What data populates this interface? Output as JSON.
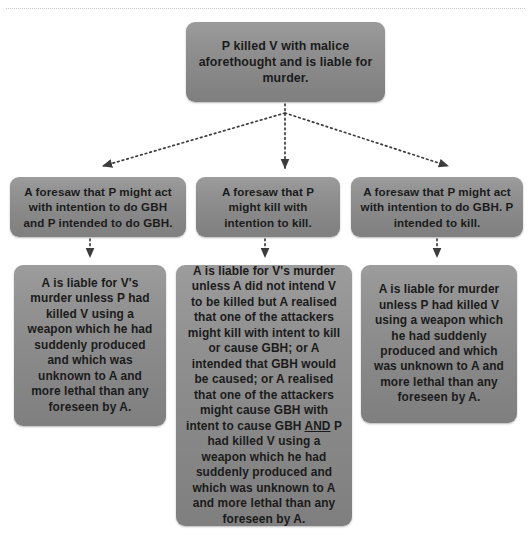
{
  "diagram": {
    "type": "flowchart",
    "title_text": "P killed V with malice aforethought and is liable for murder.",
    "root": {
      "id": "root",
      "text": "P killed V with malice aforethought and is liable for murder."
    },
    "branches": [
      {
        "id": "branch-1",
        "text": "A foresaw that P might act with intention to do GBH and P intended to do GBH."
      },
      {
        "id": "branch-2",
        "text": "A foresaw that P might kill with intention to kill."
      },
      {
        "id": "branch-3",
        "text": "A foresaw that P might act with intention to do GBH. P intended to kill."
      }
    ],
    "outcomes": [
      {
        "id": "outcome-1",
        "text": "A is liable for V's murder unless P had killed V using a weapon which he had suddenly produced and which was unknown to A and more lethal than any foreseen by A."
      },
      {
        "id": "outcome-2",
        "text_before_emphasis": "A is liable for V's murder unless A did not intend V to be killed but A realised that one of the attackers might kill with intent to kill or cause GBH; or A intended that GBH would be caused; or A realised that one of the attackers might cause GBH with intent to cause GBH ",
        "emphasis": "AND",
        "text_after_emphasis": " P had killed V using a weapon which he had suddenly produced and which was unknown to A and more lethal than any foreseen by A."
      },
      {
        "id": "outcome-3",
        "text": "A is liable for murder unless P had killed V using a weapon which he had suddenly produced and which was unknown to A and more lethal than any foreseen by A."
      }
    ],
    "connectors": [
      {
        "from": "root",
        "to": "branch-1",
        "style": "dotted-arrow"
      },
      {
        "from": "root",
        "to": "branch-2",
        "style": "dotted-arrow"
      },
      {
        "from": "root",
        "to": "branch-3",
        "style": "dotted-arrow"
      },
      {
        "from": "branch-1",
        "to": "outcome-1",
        "style": "dotted-arrow"
      },
      {
        "from": "branch-2",
        "to": "outcome-2",
        "style": "dotted-arrow"
      },
      {
        "from": "branch-3",
        "to": "outcome-3",
        "style": "dotted-arrow"
      }
    ],
    "colors": {
      "node_fill_top": "#9c9c9c",
      "node_fill_bottom": "#7f7f7f",
      "node_text": "#1b1b1b",
      "connector": "#3c3c3c",
      "page_background": "#ffffff",
      "top_rule": "#9aa0a6"
    }
  }
}
